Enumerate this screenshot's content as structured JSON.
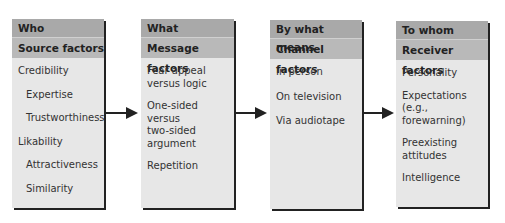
{
  "columns": [
    {
      "question": "Who",
      "factor": "Source factors",
      "items": [
        {
          "label": "Credibility",
          "level": 0
        },
        {
          "label": "Expertise",
          "level": 1
        },
        {
          "label": "Trustworthiness",
          "level": 1
        },
        {
          "label": "Likability",
          "level": 0
        },
        {
          "label": "Attractiveness",
          "level": 1
        },
        {
          "label": "Similarity",
          "level": 1
        }
      ]
    },
    {
      "question": "What",
      "factor": "Message factors",
      "items": [
        {
          "label": "Fear appeal\nversus logic",
          "level": 0
        },
        {
          "label": "One-sided versus\ntwo-sided\nargument",
          "level": 0
        },
        {
          "label": "Repetition",
          "level": 0
        }
      ]
    },
    {
      "question": "By what means",
      "factor": "Channel factors",
      "items": [
        {
          "label": "In person",
          "level": 0
        },
        {
          "label": "On television",
          "level": 0
        },
        {
          "label": "Via audiotape",
          "level": 0
        }
      ]
    },
    {
      "question": "To whom",
      "factor": "Receiver factors",
      "items": [
        {
          "label": "Personality",
          "level": 0
        },
        {
          "label": "Expectations\n(e.g., forewarning)",
          "level": 0
        },
        {
          "label": "Preexisting\nattitudes",
          "level": 0
        },
        {
          "label": "Intelligence",
          "level": 0
        }
      ]
    }
  ],
  "colors": {
    "header_dark": "#a9a9a9",
    "header_light": "#b9b9b9",
    "body": "#e7e7e7",
    "arrow": "#222222"
  }
}
